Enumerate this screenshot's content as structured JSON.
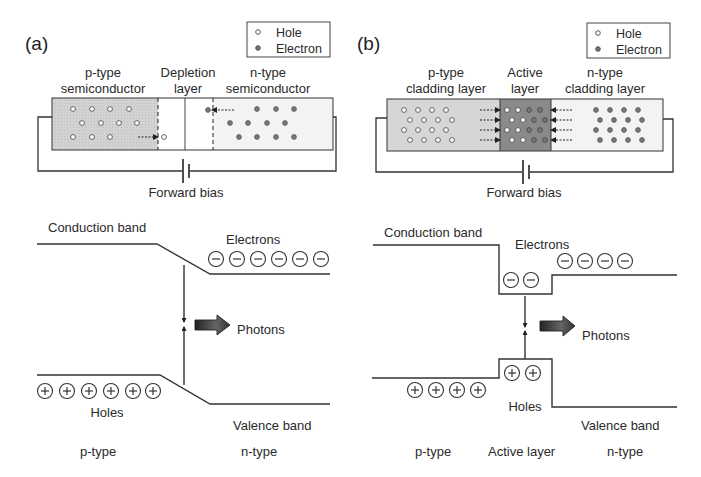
{
  "panels": [
    {
      "id": "a",
      "label": "(a)",
      "legend": {
        "hole": "Hole",
        "electron": "Electron"
      },
      "regions": {
        "left_line1": "p-type",
        "left_line2": "semiconductor",
        "mid_line1": "Depletion",
        "mid_line2": "layer",
        "right_line1": "n-type",
        "right_line2": "semiconductor"
      },
      "bias_label": "Forward bias",
      "band": {
        "conduction": "Conduction band",
        "valence": "Valence band",
        "electrons": "Electrons",
        "holes": "Holes",
        "photons": "Photons",
        "electron_count": 6,
        "hole_count": 6,
        "bottom_left": "p-type",
        "bottom_right": "n-type"
      }
    },
    {
      "id": "b",
      "label": "(b)",
      "legend": {
        "hole": "Hole",
        "electron": "Electron"
      },
      "regions": {
        "left_line1": "p-type",
        "left_line2": "cladding layer",
        "mid_line1": "Active",
        "mid_line2": "layer",
        "right_line1": "n-type",
        "right_line2": "cladding layer"
      },
      "bias_label": "Forward bias",
      "band": {
        "conduction": "Conduction band",
        "valence": "Valence band",
        "electrons": "Electrons",
        "holes": "Holes",
        "photons": "Photons",
        "electron_count_active": 2,
        "electron_count_cladding": 4,
        "hole_count_active": 2,
        "hole_count_cladding": 4,
        "bottom_left": "p-type",
        "bottom_mid": "Active layer",
        "bottom_right": "n-type"
      }
    }
  ],
  "colors": {
    "p_region_a": "#d4d4d4",
    "p_cladding_b": "#d6d6d6",
    "active_layer_b": "#8a8a8a",
    "n_region": "#f2f2f2",
    "electron_fill": "#777777",
    "hole_fill": "#ffffff",
    "ink": "#333333"
  }
}
